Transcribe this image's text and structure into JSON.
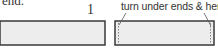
{
  "caption_fragment": "end.",
  "step_number": "1",
  "annotation": "turn under ends & hem",
  "colors": {
    "outline": "#3a3a3a",
    "fill": "#ededed",
    "text": "#333333"
  }
}
